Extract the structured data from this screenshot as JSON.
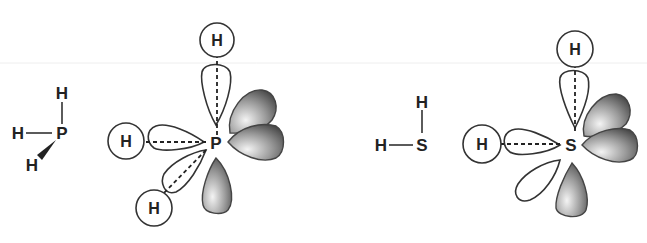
{
  "diagram": {
    "molecules": [
      {
        "name": "PH3",
        "central_atom": "P",
        "structural": {
          "central": "P",
          "substituents": [
            "H",
            "H",
            "H"
          ],
          "bonds": [
            "line-up",
            "line-left",
            "wedge-down-left"
          ]
        },
        "orbital_view": {
          "central": "P",
          "bonded_hydrogens": [
            "H",
            "H",
            "H"
          ],
          "open_lobes": 3,
          "shaded_lobes": 3
        }
      },
      {
        "name": "H2S",
        "central_atom": "S",
        "structural": {
          "central": "S",
          "substituents": [
            "H",
            "H"
          ],
          "bonds": [
            "line-up",
            "line-left"
          ]
        },
        "orbital_view": {
          "central": "S",
          "bonded_hydrogens": [
            "H",
            "H"
          ],
          "open_lobes": 3,
          "shaded_lobes": 3
        }
      }
    ],
    "labels": {
      "p": "P",
      "s": "S",
      "h": "H"
    },
    "colors": {
      "outline": "#333333",
      "shade_dark": "#555555",
      "shade_light": "#f2f2f2",
      "background": "#ffffff"
    }
  }
}
